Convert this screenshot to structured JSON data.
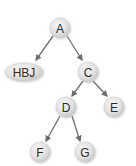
{
  "diagram": {
    "type": "binary-tree",
    "colors": {
      "node_fill_light": "#f4f4f4",
      "node_fill_dark": "#cfcfcf",
      "node_shadow": "#b0b0b0",
      "edge": "#6e6e6e",
      "label": "#2a2a2a"
    },
    "nodes": [
      {
        "id": "A",
        "label": "A",
        "x": 60,
        "y": 28,
        "rx": 10,
        "ry": 10
      },
      {
        "id": "HBJ",
        "label": "HBJ",
        "x": 24,
        "y": 72,
        "rx": 19,
        "ry": 9
      },
      {
        "id": "C",
        "label": "C",
        "x": 88,
        "y": 72,
        "rx": 10,
        "ry": 10
      },
      {
        "id": "D",
        "label": "D",
        "x": 66,
        "y": 107,
        "rx": 10,
        "ry": 10
      },
      {
        "id": "E",
        "label": "E",
        "x": 114,
        "y": 107,
        "rx": 10,
        "ry": 10
      },
      {
        "id": "F",
        "label": "F",
        "x": 40,
        "y": 152,
        "rx": 10,
        "ry": 10
      },
      {
        "id": "G",
        "label": "G",
        "x": 85,
        "y": 152,
        "rx": 10,
        "ry": 10
      }
    ],
    "edges": [
      {
        "from": "A",
        "to": "HBJ",
        "x1": 53,
        "y1": 36,
        "x2": 36,
        "y2": 60
      },
      {
        "from": "A",
        "to": "C",
        "x1": 67,
        "y1": 36,
        "x2": 82,
        "y2": 60
      },
      {
        "from": "C",
        "to": "D",
        "x1": 83,
        "y1": 81,
        "x2": 72,
        "y2": 96
      },
      {
        "from": "C",
        "to": "E",
        "x1": 93,
        "y1": 81,
        "x2": 107,
        "y2": 96
      },
      {
        "from": "D",
        "to": "F",
        "x1": 60,
        "y1": 116,
        "x2": 46,
        "y2": 141
      },
      {
        "from": "D",
        "to": "G",
        "x1": 72,
        "y1": 116,
        "x2": 80,
        "y2": 141
      }
    ]
  }
}
